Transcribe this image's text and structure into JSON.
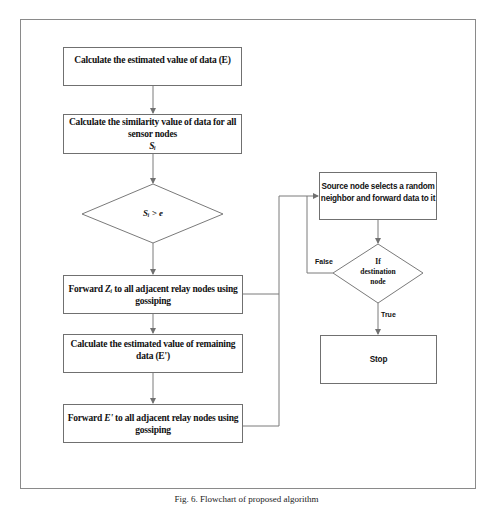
{
  "figure": {
    "caption": "Fig. 6. Flowchart of proposed algorithm"
  },
  "nodes": {
    "calc_estimate": {
      "text": "Calculate the estimated value of data (E)"
    },
    "calc_similarity": {
      "line1": "Calculate the similarity value of data for all",
      "line2": "sensor  nodes",
      "symbol": "Sᵢ"
    },
    "decision_threshold": {
      "text": "Sᵢ > e"
    },
    "forward_z": {
      "prefix": "Forward ",
      "symbol": "Zᵢ",
      "suffix": "  to all adjacent relay nodes using",
      "line2": "gossiping"
    },
    "calc_remaining": {
      "line1": "Calculate the estimated value of remaining",
      "line2": "data (E')"
    },
    "forward_e": {
      "prefix": "Forward ",
      "symbol": "E'",
      "suffix": " to all adjacent relay nodes using",
      "line2": "gossiping"
    },
    "source_select": {
      "line1": "Source node selects a random",
      "line2": "neighbor and forward data to it"
    },
    "decision_destination": {
      "line1": "If",
      "line2": "destination",
      "line3": "node"
    },
    "stop": {
      "text": "Stop"
    }
  },
  "edges": {
    "false_label": "False",
    "true_label": "True"
  }
}
